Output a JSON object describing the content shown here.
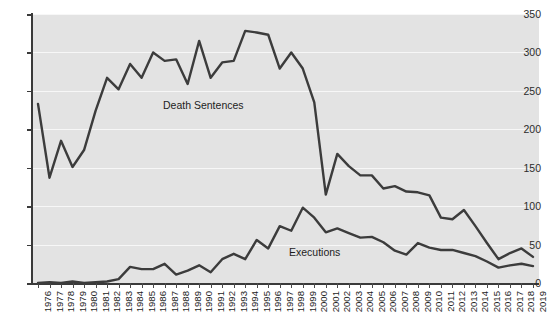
{
  "chart_data": {
    "type": "line",
    "title": "",
    "xlabel": "",
    "ylabel": "",
    "ylim": [
      0,
      350
    ],
    "yticks": [
      0,
      50,
      100,
      150,
      200,
      250,
      300,
      350
    ],
    "ytick_labels": [
      "0",
      "50",
      "100",
      "150",
      "200",
      "250",
      "300",
      "350"
    ],
    "grid": "horizontal-white-gridlines",
    "legend_position": "inline-annotations",
    "plot_background_color": "#e3e3e3",
    "line_color": "#3c3c3c",
    "categories": [
      "1976",
      "1977",
      "1978",
      "1979",
      "1980",
      "1981",
      "1982",
      "1983",
      "1984",
      "1985",
      "1986",
      "1987",
      "1988",
      "1989",
      "1990",
      "1991",
      "1992",
      "1993",
      "1994",
      "1995",
      "1996",
      "1997",
      "1998",
      "1999",
      "2000",
      "2001",
      "2002",
      "2003",
      "2004",
      "2005",
      "2006",
      "2007",
      "2008",
      "2009",
      "2010",
      "2011",
      "2012",
      "2013",
      "2014",
      "2015",
      "2016",
      "2017",
      "2018",
      "2019"
    ],
    "series": [
      {
        "name": "Death Sentences",
        "values": [
          233,
          137,
          185,
          151,
          173,
          224,
          267,
          252,
          285,
          267,
          300,
          289,
          291,
          259,
          315,
          267,
          287,
          289,
          328,
          326,
          323,
          279,
          300,
          279,
          235,
          115,
          168,
          152,
          140,
          140,
          123,
          126,
          119,
          118,
          114,
          85,
          83,
          95,
          74,
          52,
          31,
          39,
          45,
          34
        ]
      },
      {
        "name": "Executions",
        "values": [
          0,
          1,
          0,
          2,
          0,
          1,
          2,
          5,
          21,
          18,
          18,
          25,
          11,
          16,
          23,
          14,
          31,
          38,
          31,
          56,
          45,
          74,
          68,
          98,
          85,
          66,
          71,
          65,
          59,
          60,
          53,
          42,
          37,
          52,
          46,
          43,
          43,
          39,
          35,
          28,
          20,
          23,
          25,
          22
        ]
      }
    ],
    "annotations": [
      {
        "text": "Death Sentences",
        "series": "Death Sentences"
      },
      {
        "text": "Executions",
        "series": "Executions"
      }
    ]
  }
}
